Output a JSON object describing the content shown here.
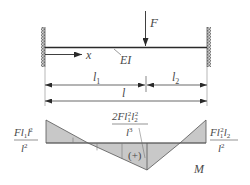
{
  "diagram": {
    "type": "fixed-fixed beam with point load and bending moment diagram",
    "labels": {
      "force": "F",
      "axis": "x",
      "stiffness": "EI",
      "segment1": "l",
      "segment1_sub": "1",
      "segment2": "l",
      "segment2_sub": "2",
      "total_length": "l",
      "moment_label": "M",
      "positive_sign": "(+)"
    },
    "moment_values": {
      "left_end": {
        "numerator": "Fl",
        "num_sub1": "1",
        "num_l2": "l",
        "num_sub2": "2",
        "num_sup2": "2",
        "denominator": "l",
        "den_sup": "2"
      },
      "under_load": {
        "numerator_coef": "2Fl",
        "num_sub1": "1",
        "num_sup1": "2",
        "num_l2": "l",
        "num_sub2": "2",
        "num_sup2": "2",
        "denominator": "l",
        "den_sup": "3"
      },
      "right_end": {
        "numerator": "Fl",
        "num_sub1": "1",
        "num_sup1": "2",
        "num_l2": "l",
        "num_sub2": "2",
        "denominator": "l",
        "den_sup": "2"
      }
    },
    "colors": {
      "line": "#2a2a2a",
      "fill": "#c8c8c8",
      "text": "#4a4a4a"
    }
  }
}
